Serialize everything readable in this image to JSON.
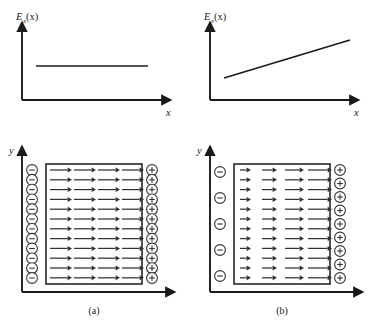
{
  "figure": {
    "background_color": "#ffffff",
    "ink_color": "#1a1a1a",
    "arrow_color": "#333333"
  },
  "panels": [
    {
      "id": "graph-a",
      "kind": "graph",
      "y_axis_label_base": "E",
      "y_axis_label_sub": "x",
      "y_axis_label_arg": "(x)",
      "x_axis_label": "x",
      "curve_description": "constant horizontal line"
    },
    {
      "id": "graph-b",
      "kind": "graph",
      "y_axis_label_base": "E",
      "y_axis_label_sub": "x",
      "y_axis_label_arg": "(x)",
      "x_axis_label": "x",
      "curve_description": "linearly increasing line"
    },
    {
      "id": "field-a",
      "kind": "field-diagram",
      "y_axis_label": "y",
      "caption": "(a)",
      "negative_charge_count": 12,
      "positive_charge_count": 12,
      "arrow_row_count": 12,
      "arrow_columns": 4,
      "arrow_uniform": true,
      "charge_minus_symbol": "minus-sign",
      "charge_plus_symbol": "plus-sign"
    },
    {
      "id": "field-b",
      "kind": "field-diagram",
      "y_axis_label": "y",
      "caption": "(b)",
      "negative_charge_count": 5,
      "positive_charge_count": 9,
      "arrow_row_count": 12,
      "arrow_columns": 4,
      "arrow_uniform": false,
      "charge_minus_symbol": "minus-sign",
      "charge_plus_symbol": "plus-sign"
    }
  ],
  "chart_data": [
    {
      "type": "line",
      "id": "graph-a",
      "title": "",
      "xlabel": "x",
      "ylabel": "E_x(x)",
      "x": [
        0.12,
        0.95
      ],
      "y": [
        0.55,
        0.55
      ],
      "grid": false,
      "legend": "none",
      "xlim": [
        0,
        1
      ],
      "ylim": [
        0,
        1
      ],
      "annotation": "Uniform field: E_x is constant with x"
    },
    {
      "type": "line",
      "id": "graph-b",
      "title": "",
      "xlabel": "x",
      "ylabel": "E_x(x)",
      "x": [
        0.12,
        0.95
      ],
      "y": [
        0.26,
        0.78
      ],
      "grid": false,
      "legend": "none",
      "xlim": [
        0,
        1
      ],
      "ylim": [
        0,
        1
      ],
      "annotation": "Non-uniform field: E_x increases linearly with x"
    }
  ],
  "geometry": {
    "graph_a": {
      "origin_x": 22,
      "origin_y": 100,
      "y_axis_top": 26,
      "x_axis_right": 168,
      "line_x1": 36,
      "line_x2": 148,
      "line_y": 66
    },
    "graph_b": {
      "origin_x": 22,
      "origin_y": 100,
      "y_axis_top": 26,
      "x_axis_right": 168,
      "line_x1": 36,
      "line_y1": 78,
      "line_x2": 162,
      "line_y2": 40
    },
    "field_a": {
      "origin_x": 22,
      "origin_y": 170,
      "y_axis_top": 28,
      "x_axis_right": 172,
      "box_x": 46,
      "box_y": 42,
      "box_w": 96,
      "box_h": 120,
      "minus_col_x": 32,
      "plus_col_x": 152,
      "charge_r": 5.4,
      "row_top": 48,
      "row_step": 9.8,
      "arrow_start": 50,
      "seg_len": 22,
      "seg_gap": 2
    },
    "field_b": {
      "origin_x": 22,
      "origin_y": 170,
      "y_axis_top": 28,
      "x_axis_right": 172,
      "box_x": 46,
      "box_y": 42,
      "box_w": 96,
      "box_h": 120,
      "minus_col_x": 32,
      "plus_col_x": 152,
      "charge_r": 5.4,
      "row_top": 48,
      "row_step": 9.8,
      "arrow_start": 50,
      "seg_lengths": [
        11,
        15,
        19,
        24
      ]
    }
  }
}
